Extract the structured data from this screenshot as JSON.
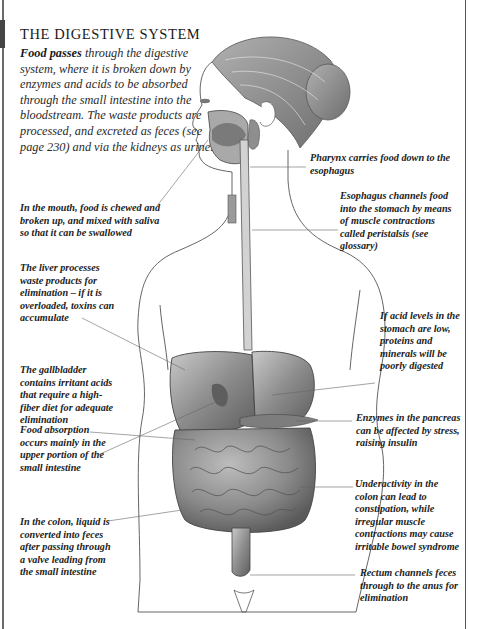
{
  "page": {
    "title": "THE DIGESTIVE SYSTEM",
    "intro": {
      "lead": "Food passes",
      "body": " through the digestive system, where it is broken down by enzymes and acids to be absorbed through the small intestine into the bloodstream. The waste products are processed, and excreted as feces (see page 230) and via the kidneys as urine."
    }
  },
  "labels": {
    "mouth": "In the mouth, food is chewed and broken up, and mixed with saliva so that it can be swallowed",
    "pharynx": "Pharynx carries food down to the esophagus",
    "esophagus": "Esophagus channels food into the stomach by means of muscle contractions called peristalsis (see glossary)",
    "liver": "The liver processes waste products for elimination – if it is overloaded, toxins can accumulate",
    "stomach_acid": "If acid levels in the stomach are low, proteins and minerals will be poorly digested",
    "gallbladder": "The gallbladder contains irritant acids that require a high-fiber diet for adequate elimination",
    "pancreas": "Enzymes in the pancreas can be affected by stress, raising insulin",
    "small_intestine": "Food absorption occurs mainly in the upper portion of the small intestine",
    "colon_under": "Underactivity in the colon can lead to constipation, while irregular muscle contractions may cause irritable bowel syndrome",
    "colon_liquid": "In the colon, liquid is converted into feces after passing through a valve leading from the small intestine",
    "rectum": "Rectum channels feces through to the anus for elimination"
  },
  "illustration": {
    "subject": "female-torso-digestive-anatomy",
    "colors": {
      "line": "#444444",
      "organ": "#9a9a9a",
      "organ_dark": "#6d6d6d",
      "hair": "#8a8a8a",
      "skin": "#ffffff"
    }
  }
}
